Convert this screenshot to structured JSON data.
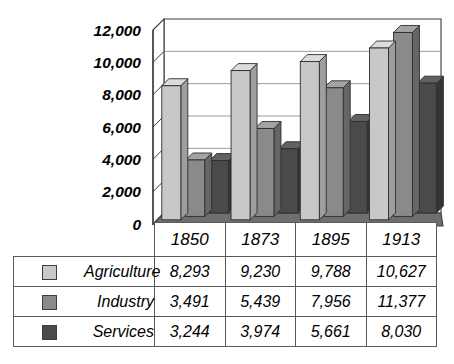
{
  "chart_data": {
    "type": "bar",
    "title": "",
    "subtitle": "",
    "xlabel": "",
    "ylabel": "",
    "categories": [
      "1850",
      "1873",
      "1895",
      "1913"
    ],
    "series": [
      {
        "name": "Agriculture",
        "values": [
          8293,
          9230,
          9788,
          10627
        ],
        "color": "#c8c8c8"
      },
      {
        "name": "Industry",
        "values": [
          3491,
          5439,
          7956,
          11377
        ],
        "color": "#8a8a8a"
      },
      {
        "name": "Services",
        "values": [
          3244,
          3974,
          5661,
          8030
        ],
        "color": "#4a4a4a"
      }
    ],
    "ylim": [
      0,
      12000
    ],
    "ytick_labels": [
      "12,000",
      "10,000",
      "8,000",
      "6,000",
      "4,000",
      "2,000",
      "0"
    ],
    "ytick_values": [
      12000,
      10000,
      8000,
      6000,
      4000,
      2000,
      0
    ],
    "grid": true,
    "grid_axis": "y",
    "legend_position": "data-table-left",
    "three_d": true,
    "display_values": [
      [
        "8,293",
        "9,230",
        "9,788",
        "10,627"
      ],
      [
        "3,491",
        "5,439",
        "7,956",
        "11,377"
      ],
      [
        "3,244",
        "3,974",
        "5,661",
        "8,030"
      ]
    ]
  },
  "table": {
    "year_header": [
      "1850",
      "1873",
      "1895",
      "1913"
    ],
    "rows": [
      {
        "name": "Agriculture",
        "swatch_color": "#c8c8c8",
        "values": [
          "8,293",
          "9,230",
          "9,788",
          "10,627"
        ]
      },
      {
        "name": "Industry",
        "swatch_color": "#8a8a8a",
        "values": [
          "3,491",
          "5,439",
          "7,956",
          "11,377"
        ]
      },
      {
        "name": "Services",
        "swatch_color": "#4a4a4a",
        "values": [
          "3,244",
          "3,974",
          "5,661",
          "8,030"
        ]
      }
    ]
  },
  "axis": {
    "y_labels": [
      "12,000",
      "10,000",
      "8,000",
      "6,000",
      "4,000",
      "2,000",
      "0"
    ]
  },
  "colors": {
    "agriculture_face": "#c8c8c8",
    "agriculture_side": "#9e9e9e",
    "agriculture_top": "#dcdcdc",
    "industry_face": "#8a8a8a",
    "industry_side": "#666666",
    "industry_top": "#a3a3a3",
    "services_face": "#4a4a4a",
    "services_side": "#353535",
    "services_top": "#616161",
    "floor": "#6e6e6e",
    "axis_line": "#3d3d3d",
    "grid_line": "#9a9a9a",
    "background": "#ffffff"
  }
}
